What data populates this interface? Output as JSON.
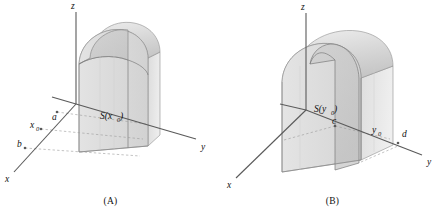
{
  "figure": {
    "background_color": "#ffffff",
    "line_color": "#5a5a5a",
    "label_color": "#111111",
    "solid_fill": "#d9d9d9",
    "solid_fill_light": "#e8e8e8",
    "solid_fill_dark": "#c2c2c2",
    "solid_stroke": "#6f6f6f",
    "dashed_color": "#9a9a9a"
  },
  "panels": [
    {
      "id": "panel-a",
      "caption": "(A)",
      "axes": {
        "z_label": "z",
        "y_label": "y",
        "x_label": "x"
      },
      "marks": [
        {
          "name": "a",
          "label": "a"
        },
        {
          "name": "x0",
          "label": "x",
          "subscript": "0"
        },
        {
          "name": "b",
          "label": "b"
        }
      ],
      "region": {
        "label": "S(x",
        "subscript": "0",
        "label_end": ")"
      }
    },
    {
      "id": "panel-b",
      "caption": "(B)",
      "axes": {
        "z_label": "z",
        "y_label": "y",
        "x_label": "x"
      },
      "marks": [
        {
          "name": "c",
          "label": "c"
        },
        {
          "name": "y0",
          "label": "y",
          "subscript": "0"
        },
        {
          "name": "d",
          "label": "d"
        }
      ],
      "region": {
        "label": "S(y",
        "subscript": "0",
        "label_end": ")"
      }
    }
  ]
}
